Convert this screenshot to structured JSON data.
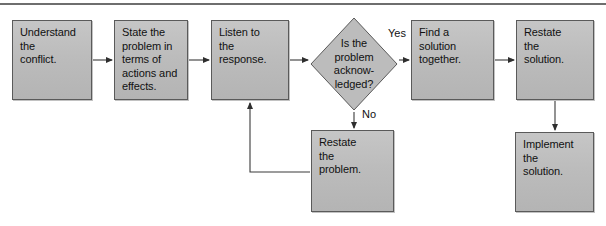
{
  "figure": {
    "background_color": "#ffffff",
    "node_fill_color": "#bcbcbc",
    "node_border_color": "#5a5a5a",
    "connector_color": "#3a3a3a",
    "rule_color": "#6e6e6e"
  },
  "nodes": [
    {
      "id": "understand-the-conflict",
      "shape": "process",
      "text": "Understand\nthe\nconflict.",
      "x": 12,
      "y": 20,
      "w": 80,
      "h": 80
    },
    {
      "id": "state-the-problem",
      "shape": "process",
      "text": "State the\nproblem in\nterms of\nactions and\neffects.",
      "x": 114,
      "y": 20,
      "w": 74,
      "h": 80
    },
    {
      "id": "listen-to-the-response",
      "shape": "process",
      "text": "Listen to\nthe\nresponse.",
      "x": 211,
      "y": 20,
      "w": 78,
      "h": 80
    },
    {
      "id": "is-the-problem-acknowledged",
      "shape": "decision",
      "text": "Is the\nproblem\nacknow-\nledged?",
      "x": 310,
      "y": 17,
      "w": 88,
      "h": 94
    },
    {
      "id": "find-a-solution-together",
      "shape": "process",
      "text": "Find a\nsolution\ntogether.",
      "x": 411,
      "y": 20,
      "w": 83,
      "h": 80
    },
    {
      "id": "restate-the-solution",
      "shape": "process",
      "text": "Restate\nthe\nsolution.",
      "x": 516,
      "y": 20,
      "w": 78,
      "h": 80
    },
    {
      "id": "restate-the-problem",
      "shape": "process",
      "text": "Restate\nthe\nproblem.",
      "x": 311,
      "y": 130,
      "w": 83,
      "h": 82
    },
    {
      "id": "implement-the-solution",
      "shape": "process",
      "text": "Implement\nthe\nsolution.",
      "x": 515,
      "y": 132,
      "w": 79,
      "h": 80
    }
  ],
  "edges": [
    {
      "id": "understand-to-state",
      "from": "understand-the-conflict",
      "to": "state-the-problem",
      "label": "",
      "points": "93,60 112,60"
    },
    {
      "id": "state-to-listen",
      "from": "state-the-problem",
      "to": "listen-to-the-response",
      "label": "",
      "points": "189,60 209,60"
    },
    {
      "id": "listen-to-decision",
      "from": "listen-to-the-response",
      "to": "is-the-problem-acknowledged",
      "label": "",
      "points": "290,60 308,60"
    },
    {
      "id": "decision-yes-to-find-solution",
      "from": "is-the-problem-acknowledged",
      "to": "find-a-solution-together",
      "label": "Yes",
      "points": "399,60 409,60"
    },
    {
      "id": "find-solution-to-restate-solution",
      "from": "find-a-solution-together",
      "to": "restate-the-solution",
      "label": "",
      "points": "495,60 514,60"
    },
    {
      "id": "decision-no-to-restate-problem",
      "from": "is-the-problem-acknowledged",
      "to": "restate-the-problem",
      "label": "No",
      "points": "354,112 354,128"
    },
    {
      "id": "restate-problem-back-to-listen",
      "from": "restate-the-problem",
      "to": "listen-to-the-response",
      "label": "",
      "points": "310,172 250,172 250,103"
    },
    {
      "id": "restate-solution-to-implement",
      "from": "restate-the-solution",
      "to": "implement-the-solution",
      "label": "",
      "points": "555,101 555,130"
    }
  ],
  "edge_labels": [
    {
      "id": "yes-label",
      "text": "Yes",
      "x": 388,
      "y": 27
    },
    {
      "id": "no-label",
      "text": "No",
      "x": 362,
      "y": 108
    }
  ]
}
